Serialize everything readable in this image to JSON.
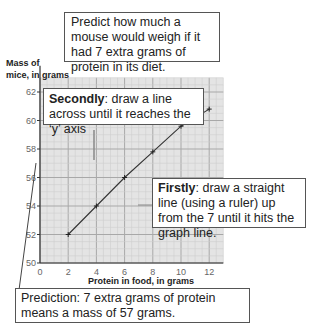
{
  "chart_data": {
    "type": "line",
    "title": "",
    "xlabel": "Protein in food, in grams",
    "ylabel": "Mass of mice, in grams",
    "x": [
      2,
      4,
      6,
      8,
      10,
      12
    ],
    "series": [
      {
        "name": "Mass of mice",
        "values": [
          52,
          54,
          56,
          57.8,
          59.6,
          60.8
        ]
      }
    ],
    "xlim": [
      0,
      13
    ],
    "ylim": [
      50,
      63
    ],
    "xticks": [
      0,
      2,
      4,
      6,
      8,
      10,
      12
    ],
    "yticks": [
      50,
      52,
      54,
      56,
      58,
      60,
      62
    ],
    "grid": true,
    "annotations": [
      "Predict how much a mouse would weigh if it had 7 extra grams of protein in its diet.",
      "Secondly: draw a line across until it reaches the 'y' axis",
      "Firstly: draw a straight line (using a ruler) up from the 7 until it hits the graph line.",
      "Prediction: 7 extra grams of protein means a mass of 57 grams."
    ]
  },
  "labels": {
    "ylabel_line1": "Mass of",
    "ylabel_line2": "mice, in grams",
    "xlabel": "Protein in food, in grams"
  },
  "boxes": {
    "question": "Predict how much a mouse would weigh if it had 7 extra grams of protein in its diet.",
    "secondly_bold": "Secondly",
    "secondly_text": ": draw a line across until it reaches the ‘y’ axis",
    "firstly_bold": "Firstly",
    "firstly_text": ": draw a straight line (using a ruler) up from the 7 until it hits the graph line.",
    "prediction": "Prediction: 7 extra grams of protein means a mass of 57 grams."
  },
  "colors": {
    "plot_bg": "#e4e4e4",
    "grid_major": "#a8a8a8",
    "grid_minor": "#cfcfcf",
    "line": "#333333"
  }
}
